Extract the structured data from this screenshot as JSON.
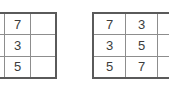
{
  "background_color": "#ffffff",
  "border_color": "#5a5a5a",
  "gridline_color": "#8d8d8d",
  "digit_color": "#3c3c3c",
  "grids": [
    {
      "name": "left-grid",
      "columns_visible": 2,
      "rows": [
        [
          "3",
          "7"
        ],
        [
          "5",
          "3"
        ],
        [
          "7",
          "5"
        ]
      ]
    },
    {
      "name": "right-grid",
      "columns_visible": 3,
      "rows": [
        [
          "7",
          "3",
          "5"
        ],
        [
          "3",
          "5",
          "7"
        ],
        [
          "5",
          "7",
          "3"
        ]
      ]
    }
  ]
}
